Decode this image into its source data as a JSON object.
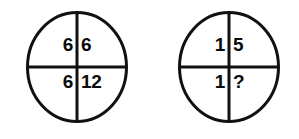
{
  "figure": {
    "stroke_color": "#111111",
    "fill_color": "#ffffff",
    "text_color": "#0b0b0b",
    "background": "#ffffff"
  },
  "circles": [
    {
      "name": "left-circle",
      "quadrants": {
        "top_left": "6",
        "top_right": "6",
        "bottom_left": "6",
        "bottom_right": "12"
      }
    },
    {
      "name": "right-circle",
      "quadrants": {
        "top_left": "1",
        "top_right": "5",
        "bottom_left": "1",
        "bottom_right": "?"
      }
    }
  ]
}
